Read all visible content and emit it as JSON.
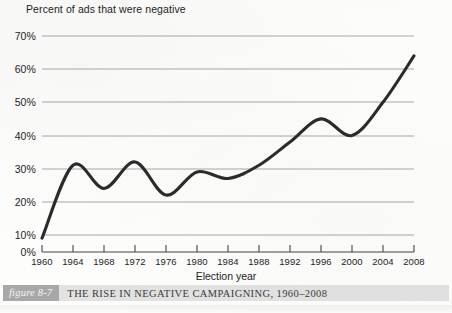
{
  "figure": {
    "badge": "figure 8-7",
    "caption": "The Rise in Negative Campaigning, 1960–2008"
  },
  "chart_data": {
    "type": "line",
    "title": "Percent of ads that were negative",
    "xlabel": "Election year",
    "ylabel": "Percent of ads that were negative",
    "x": [
      1960,
      1964,
      1968,
      1972,
      1976,
      1980,
      1984,
      1988,
      1992,
      1996,
      2000,
      2004,
      2008
    ],
    "values": [
      9,
      31,
      24,
      32,
      22,
      29,
      27,
      31,
      38,
      45,
      40,
      50,
      64
    ],
    "categories": [
      "1960",
      "1964",
      "1968",
      "1972",
      "1976",
      "1980",
      "1984",
      "1988",
      "1992",
      "1996",
      "2000",
      "2004",
      "2008"
    ],
    "ytick_labels": [
      "0%",
      "10%",
      "20%",
      "30%",
      "40%",
      "50%",
      "60%",
      "70%"
    ],
    "yticks": [
      0,
      10,
      20,
      30,
      40,
      50,
      60,
      70
    ],
    "ylim": [
      0,
      70
    ],
    "xlim": [
      1960,
      2008
    ],
    "grid": true,
    "legend": null,
    "line_color": "#2b2b2b",
    "grid_color": "#a0a0a0"
  }
}
